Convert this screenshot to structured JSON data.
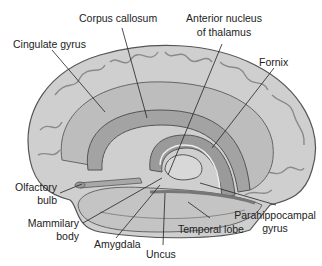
{
  "diagram": {
    "labels": {
      "corpus_callosum": "Corpus callosum",
      "cingulate_gyrus": "Cingulate gyrus",
      "anterior_nucleus_line1": "Anterior nucleus",
      "anterior_nucleus_line2": "of thalamus",
      "fornix": "Fornix",
      "olfactory_bulb_line1": "Olfactory",
      "olfactory_bulb_line2": "bulb",
      "mammilary_body_line1": "Mammilary",
      "mammilary_body_line2": "body",
      "amygdala": "Amygdala",
      "uncus": "Uncus",
      "temporal_lobe": "Temporal lobe",
      "parahippocampal_line1": "Parahippocampal",
      "parahippocampal_line2": "gyrus"
    },
    "colors": {
      "cortex": "#cfcfcf",
      "cortex_dark": "#8a8a8a",
      "limbic_band": "#b5b5b5",
      "corpus_callosum": "#a3a3a3",
      "inner": "#9a9a9a",
      "outline": "#555555",
      "leader": "#222222"
    }
  }
}
